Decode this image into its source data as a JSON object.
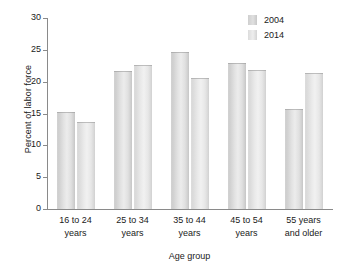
{
  "chart_data": {
    "type": "bar",
    "title": "",
    "xlabel": "Age group",
    "ylabel": "Percent of labor force",
    "categories": [
      "16 to 24 years",
      "25 to 34 years",
      "35 to 44 years",
      "45 to 54 years",
      "55 years and older"
    ],
    "category_lines": [
      [
        "16 to 24",
        "years"
      ],
      [
        "25 to 34",
        "years"
      ],
      [
        "35 to 44",
        "years"
      ],
      [
        "45 to 54",
        "years"
      ],
      [
        "55 years",
        "and older"
      ]
    ],
    "series": [
      {
        "name": "2004",
        "values": [
          15.2,
          21.7,
          24.7,
          23.0,
          15.7
        ],
        "color": "#dcdcdc"
      },
      {
        "name": "2014",
        "values": [
          13.7,
          22.6,
          20.6,
          21.9,
          21.4
        ],
        "color": "#e8e8e8"
      }
    ],
    "ylim": [
      0,
      30
    ],
    "yticks": [
      0,
      5,
      10,
      15,
      20,
      25,
      30
    ],
    "ytick_labels": [
      "0",
      "5",
      "10",
      "15",
      "20",
      "25",
      "30"
    ],
    "grid": false,
    "legend_position": "top-right"
  },
  "legend": {
    "entries": [
      {
        "label": "2004"
      },
      {
        "label": "2014"
      }
    ]
  },
  "axes": {
    "y_title": "Percent of labor force",
    "x_title": "Age group"
  }
}
